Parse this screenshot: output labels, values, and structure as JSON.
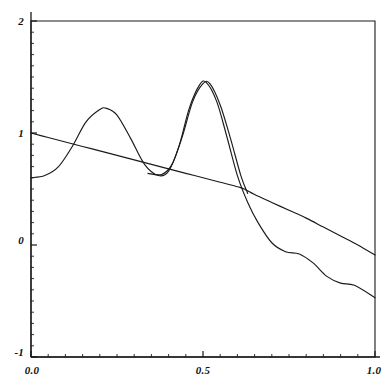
{
  "chart_data": {
    "type": "line",
    "title": "",
    "xlabel": "",
    "ylabel": "",
    "xlim": [
      0.0,
      1.0
    ],
    "ylim": [
      -1,
      2
    ],
    "grid": false,
    "legend": "none",
    "xticks": [
      0.0,
      0.5,
      1.0
    ],
    "xtick_labels": [
      "0.0",
      "0.5",
      "1.0"
    ],
    "yticks": [
      -1,
      0,
      1,
      2
    ],
    "ytick_labels": [
      "-1",
      "0",
      "1",
      "2"
    ],
    "x_minor_tick_step": 0.05,
    "y_minor_tick_step": 0.1,
    "line_color": "#1a1a1a",
    "axis_color": "#1a1a1a",
    "background_color": "#ffffff",
    "series": [
      {
        "name": "smooth-decay-curve",
        "comment": "monotone, nearly straight descending trace from 1.0 at x=0 to about -0.09 at x=1.0",
        "x": [
          0.0,
          0.05,
          0.1,
          0.15,
          0.2,
          0.25,
          0.3,
          0.35,
          0.4,
          0.45,
          0.5,
          0.55,
          0.6,
          0.62,
          0.65,
          0.7,
          0.75,
          0.8,
          0.85,
          0.9,
          0.95,
          1.0
        ],
        "values": [
          1.0,
          0.96,
          0.92,
          0.88,
          0.84,
          0.8,
          0.76,
          0.72,
          0.68,
          0.64,
          0.6,
          0.56,
          0.52,
          0.5,
          0.45,
          0.38,
          0.31,
          0.24,
          0.16,
          0.08,
          0.0,
          -0.09
        ]
      },
      {
        "name": "oscillating-curve-1",
        "comment": "double-humped trace: small bump near x=0.22, tall sharp peak near x=0.50, then decaying wiggles",
        "x": [
          0.0,
          0.04,
          0.08,
          0.12,
          0.16,
          0.2,
          0.22,
          0.25,
          0.29,
          0.33,
          0.37,
          0.4,
          0.43,
          0.46,
          0.49,
          0.51,
          0.54,
          0.57,
          0.6,
          0.63,
          0.66,
          0.7,
          0.74,
          0.78,
          0.82,
          0.86,
          0.9,
          0.94,
          1.0
        ],
        "values": [
          0.6,
          0.62,
          0.7,
          0.88,
          1.1,
          1.21,
          1.22,
          1.16,
          0.95,
          0.72,
          0.62,
          0.66,
          0.88,
          1.22,
          1.43,
          1.45,
          1.28,
          0.96,
          0.62,
          0.38,
          0.2,
          0.02,
          -0.06,
          -0.08,
          -0.16,
          -0.28,
          -0.34,
          -0.36,
          -0.47
        ]
      },
      {
        "name": "oscillating-curve-2",
        "comment": "companion trace nearly coincident with curve 1, shifted slightly right near the main peak; merges with the smooth curve after x=0.63",
        "x": [
          0.34,
          0.38,
          0.41,
          0.44,
          0.47,
          0.5,
          0.52,
          0.55,
          0.58,
          0.61,
          0.63
        ],
        "values": [
          0.64,
          0.63,
          0.72,
          0.97,
          1.28,
          1.44,
          1.44,
          1.25,
          0.95,
          0.62,
          0.46
        ]
      }
    ]
  },
  "axes": {
    "y_labels": [
      "2",
      "1",
      "0",
      "-1"
    ],
    "x_labels": [
      "0.0",
      "0.5",
      "1.0"
    ]
  }
}
